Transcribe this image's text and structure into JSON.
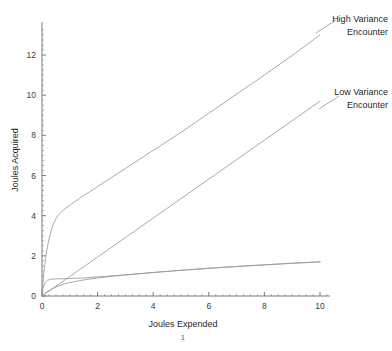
{
  "figure": {
    "note_below_xlabel": "1"
  },
  "chart_data": {
    "type": "line",
    "title": "",
    "xlabel": "Joules Expended",
    "ylabel": "Joules Acquired",
    "xlim": [
      0,
      10.3
    ],
    "ylim": [
      0,
      13.4
    ],
    "grid": false,
    "legend_position": "inline-annotations",
    "xticks": [
      0,
      2,
      4,
      6,
      8,
      10
    ],
    "xtick_labels": [
      "0",
      "2",
      "4",
      "6",
      "8",
      "10"
    ],
    "yticks": [
      0,
      2,
      4,
      6,
      8,
      10,
      12
    ],
    "ytick_labels": [
      "0",
      "2",
      "4",
      "6",
      "8",
      "10",
      "12"
    ],
    "line_color": "#9a9a9a",
    "axis_color": "#6e6e6e",
    "annotations": [
      {
        "name": "high-variance-encounter",
        "line1": "High Variance",
        "line2": "Encounter",
        "x": 10.0,
        "y": 13.0
      },
      {
        "name": "low-variance-encounter",
        "line1": "Low Variance",
        "line2": "Encounter",
        "x": 10.0,
        "y": 9.7
      }
    ],
    "series": [
      {
        "name": "High Variance Encounter",
        "x": [
          0,
          0.05,
          0.1,
          0.15,
          0.2,
          0.3,
          0.4,
          0.5,
          0.6,
          0.7,
          0.8,
          0.9,
          1.0,
          1.2,
          1.5,
          2.0,
          2.5,
          3.0,
          4.0,
          5.0,
          6.0,
          7.0,
          8.0,
          9.0,
          10.0
        ],
        "y": [
          0.25,
          0.9,
          1.55,
          2.1,
          2.5,
          3.1,
          3.55,
          3.85,
          4.05,
          4.2,
          4.32,
          4.42,
          4.52,
          4.72,
          5.0,
          5.45,
          5.9,
          6.35,
          7.25,
          8.15,
          9.1,
          10.05,
          11.0,
          11.98,
          13.0
        ]
      },
      {
        "name": "Low Variance Encounter",
        "x": [
          0,
          1.0,
          2.0,
          3.0,
          4.0,
          5.0,
          6.0,
          7.0,
          8.0,
          9.0,
          10.0
        ],
        "y": [
          0.0,
          0.97,
          1.94,
          2.91,
          3.88,
          4.85,
          5.82,
          6.79,
          7.76,
          8.73,
          9.7
        ]
      },
      {
        "name": "High Variance Acquisition Rate",
        "x": [
          0,
          0.05,
          0.1,
          0.15,
          0.2,
          0.3,
          0.5,
          0.8,
          1.0,
          1.5,
          2.0,
          3.0,
          4.0,
          5.0,
          6.0,
          7.0,
          8.0,
          9.0,
          10.0
        ],
        "y": [
          0.22,
          0.45,
          0.62,
          0.72,
          0.78,
          0.83,
          0.85,
          0.86,
          0.87,
          0.9,
          0.95,
          1.05,
          1.17,
          1.28,
          1.38,
          1.47,
          1.55,
          1.63,
          1.7
        ]
      },
      {
        "name": "Low Variance Acquisition Rate",
        "x": [
          0,
          0.1,
          0.2,
          0.4,
          0.6,
          0.8,
          1.0,
          1.5,
          2.0,
          2.5,
          3.0,
          4.0,
          5.0,
          6.0,
          7.0,
          8.0,
          9.0,
          10.0
        ],
        "y": [
          0.0,
          0.12,
          0.22,
          0.38,
          0.5,
          0.6,
          0.67,
          0.8,
          0.9,
          0.98,
          1.05,
          1.17,
          1.28,
          1.38,
          1.47,
          1.55,
          1.63,
          1.7
        ]
      }
    ]
  }
}
